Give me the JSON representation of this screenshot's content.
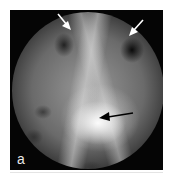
{
  "figure": {
    "panel_label": "a",
    "annotations": [
      {
        "type": "white-arrow",
        "direction": "down-right",
        "color": "#ffffff",
        "position": "top-left opening"
      },
      {
        "type": "white-arrow",
        "direction": "down-left",
        "color": "#ffffff",
        "position": "top-right opening"
      },
      {
        "type": "black-arrow",
        "direction": "left",
        "color": "#000000",
        "position": "center bright spot"
      }
    ],
    "colors": {
      "background": "#ffffff",
      "frame": "#050505",
      "label": "#e8e8e8"
    }
  }
}
